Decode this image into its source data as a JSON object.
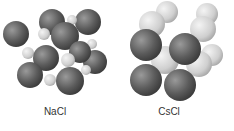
{
  "labels": {
    "left": "NaCl",
    "right": "CsCl"
  },
  "colors": {
    "dark_sphere": "#5a5a5a",
    "light_sphere": "#d8d8d8",
    "label": "#333333"
  }
}
